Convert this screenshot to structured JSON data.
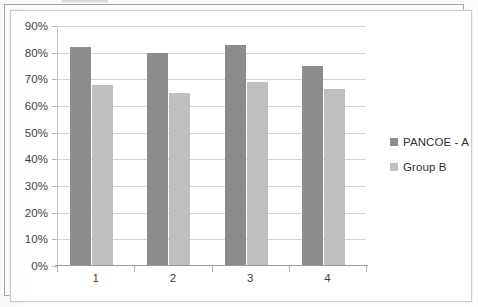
{
  "chart_data": {
    "type": "bar",
    "title": "",
    "xlabel": "",
    "ylabel": "",
    "categories": [
      "1",
      "2",
      "3",
      "4"
    ],
    "series": [
      {
        "name": "PANCOE - A",
        "color": "#8c8c8c",
        "values": [
          82,
          80,
          83,
          75
        ]
      },
      {
        "name": "Group B",
        "color": "#bfbfbf",
        "values": [
          68,
          65,
          69,
          66.5
        ]
      }
    ],
    "ylim": [
      0,
      90
    ],
    "ytick_step": 10,
    "ytick_labels": [
      "0%",
      "10%",
      "20%",
      "30%",
      "40%",
      "50%",
      "60%",
      "70%",
      "80%",
      "90%"
    ],
    "ytick_values": [
      0,
      10,
      20,
      30,
      40,
      50,
      60,
      70,
      80,
      90
    ],
    "value_format": "percent",
    "grid": true,
    "grid_axis": "y",
    "legend_position": "right"
  },
  "legend": {
    "entries": [
      {
        "label": "PANCOE - A",
        "color": "#8c8c8c"
      },
      {
        "label": "Group B",
        "color": "#bfbfbf"
      }
    ]
  },
  "axes": {
    "y_labels": [
      "90%",
      "80%",
      "70%",
      "60%",
      "50%",
      "40%",
      "30%",
      "20%",
      "10%",
      "0%"
    ],
    "x_labels": [
      "1",
      "2",
      "3",
      "4"
    ]
  },
  "colors": {
    "series_a": "#8c8c8c",
    "series_b": "#bfbfbf",
    "gridline": "#d4d4d4",
    "axis": "#9a9a9a",
    "frame_outer": "#a7a7a7",
    "frame_inner": "#cfcfcf",
    "text": "#3e3e3e",
    "page": "#ffffff"
  }
}
